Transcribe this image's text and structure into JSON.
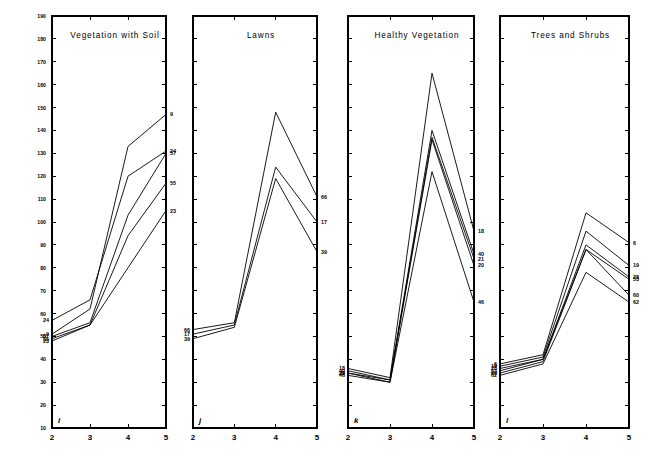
{
  "figure": {
    "background": "#ffffff",
    "ink": "#000000"
  },
  "chart_data": {
    "type": "line",
    "title": "",
    "xlabel": "",
    "ylabel": "",
    "xlim": [
      2,
      5
    ],
    "ylim": [
      10,
      190
    ],
    "x": [
      2,
      3,
      4,
      5
    ],
    "xticks": [
      "2",
      "3",
      "4",
      "5"
    ],
    "yticks": [
      "10",
      "20",
      "30",
      "40",
      "50",
      "60",
      "70",
      "80",
      "90",
      "100",
      "110",
      "120",
      "130",
      "140",
      "150",
      "160",
      "170",
      "180",
      "190"
    ],
    "ytick_values": [
      10,
      20,
      30,
      40,
      50,
      60,
      70,
      80,
      90,
      100,
      110,
      120,
      130,
      140,
      150,
      160,
      170,
      180,
      190
    ],
    "y_axis_labels_panel": "i",
    "grid": false,
    "legend": "none",
    "line_labels_position": "right-and-left-endpoints",
    "panels": [
      {
        "letter": "i",
        "title": "Vegetation with Soil",
        "series": [
          {
            "name": "9",
            "values": [
              51,
              62,
              133,
              147
            ]
          },
          {
            "name": "24",
            "values": [
              57,
              66,
              120,
              131
            ]
          },
          {
            "name": "57",
            "values": [
              50,
              56,
              103,
              130
            ]
          },
          {
            "name": "55",
            "values": [
              49,
              55,
              94,
              117
            ]
          },
          {
            "name": "23",
            "values": [
              48,
              55,
              80,
              105
            ]
          }
        ],
        "left_labels": [
          "24",
          "9",
          "57",
          "23",
          "55"
        ],
        "right_labels": [
          "9",
          "24",
          "57",
          "55",
          "23"
        ]
      },
      {
        "letter": "j",
        "title": "Lawns",
        "series": [
          {
            "name": "66",
            "values": [
              53,
              56,
              148,
              111
            ]
          },
          {
            "name": "17",
            "values": [
              51,
              55,
              124,
              100
            ]
          },
          {
            "name": "39",
            "values": [
              49,
              54,
              119,
              87
            ]
          }
        ],
        "left_labels": [
          "66",
          "17",
          "39"
        ],
        "right_labels": [
          "66",
          "17",
          "39"
        ]
      },
      {
        "letter": "k",
        "title": "Healthy Vegetation",
        "series": [
          {
            "name": "18",
            "values": [
              36,
              32,
              165,
              96
            ]
          },
          {
            "name": "40",
            "values": [
              35,
              31,
              140,
              86
            ]
          },
          {
            "name": "21",
            "values": [
              34,
              31,
              137,
              84
            ]
          },
          {
            "name": "20",
            "values": [
              34,
              30,
              136,
              81
            ]
          },
          {
            "name": "46",
            "values": [
              33,
              30,
              122,
              65
            ]
          }
        ],
        "left_labels": [
          "18",
          "20",
          "21",
          "40",
          "46"
        ],
        "right_labels": [
          "18",
          "40",
          "21",
          "20",
          "46"
        ]
      },
      {
        "letter": "l",
        "title": "Trees and Shrubs",
        "series": [
          {
            "name": "6",
            "values": [
              38,
              42,
              104,
              91
            ]
          },
          {
            "name": "19",
            "values": [
              37,
              41,
              96,
              81
            ]
          },
          {
            "name": "28",
            "values": [
              36,
              40,
              90,
              76
            ]
          },
          {
            "name": "53",
            "values": [
              35,
              40,
              88,
              75
            ]
          },
          {
            "name": "60",
            "values": [
              34,
              39,
              88,
              68
            ]
          },
          {
            "name": "62",
            "values": [
              33,
              38,
              78,
              65
            ]
          }
        ],
        "left_labels": [
          "6",
          "19",
          "28",
          "53",
          "60",
          "62"
        ],
        "right_labels": [
          "6",
          "19",
          "28",
          "53",
          "60",
          "62"
        ]
      }
    ]
  }
}
